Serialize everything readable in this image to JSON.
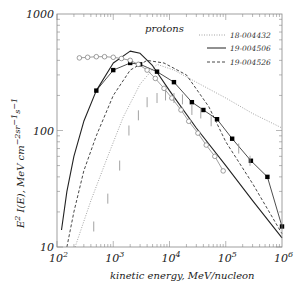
{
  "chart_data": {
    "type": "line",
    "title": "",
    "annotation": "protons",
    "xlabel": "kinetic energy,  MeV/nucleon",
    "ylabel": "E^2 I(E),  MeV cm^-2 sr^-1 s^-1",
    "xscale": "log",
    "yscale": "log",
    "xlim": [
      100,
      1000000
    ],
    "ylim": [
      10,
      1000
    ],
    "grid": false,
    "legend_position": "upper right",
    "x_ticks": [
      {
        "base": "10",
        "exp": "2"
      },
      {
        "base": "10",
        "exp": "3"
      },
      {
        "base": "10",
        "exp": "4"
      },
      {
        "base": "10",
        "exp": "5"
      },
      {
        "base": "10",
        "exp": "6"
      }
    ],
    "y_ticks": [
      "10",
      "100",
      "1000"
    ],
    "series": [
      {
        "name": "18-004432",
        "style": "dotted",
        "color": "#9a9a9a",
        "x": [
          210,
          400,
          800,
          1500,
          3000,
          6000,
          12000,
          30000,
          100000,
          300000,
          1000000
        ],
        "y": [
          10,
          25,
          60,
          130,
          250,
          370,
          330,
          260,
          190,
          140,
          105
        ]
      },
      {
        "name": "19-004506",
        "style": "solid",
        "color": "#222222",
        "x": [
          120,
          150,
          200,
          300,
          500,
          1000,
          2000,
          3000,
          5000,
          10000,
          30000,
          100000,
          300000,
          1000000
        ],
        "y": [
          14,
          30,
          60,
          120,
          220,
          380,
          480,
          460,
          360,
          220,
          105,
          50,
          25,
          12
        ]
      },
      {
        "name": "19-004526",
        "style": "dashed",
        "color": "#333333",
        "x": [
          150,
          200,
          300,
          500,
          1000,
          2000,
          4000,
          8000,
          20000,
          50000,
          100000,
          300000,
          1000000
        ],
        "y": [
          10,
          20,
          45,
          90,
          200,
          330,
          400,
          380,
          300,
          160,
          80,
          35,
          13
        ]
      },
      {
        "name": "measurements (filled squares)",
        "style": "solid-markers",
        "marker": "square",
        "color": "#000000",
        "x": [
          500,
          1000,
          2000,
          3000,
          6000,
          12000,
          25000,
          40000,
          70000,
          130000,
          280000,
          550000,
          1000000
        ],
        "y": [
          220,
          330,
          380,
          370,
          320,
          260,
          175,
          150,
          125,
          85,
          55,
          40,
          15
        ]
      },
      {
        "name": "measurements (open circles)",
        "style": "solid-markers",
        "marker": "circle",
        "color": "#777777",
        "x": [
          250,
          350,
          500,
          700,
          1000,
          1400,
          2000,
          2800,
          4000,
          5600,
          8000,
          11000,
          16000,
          22000,
          32000,
          45000,
          64000,
          90000
        ],
        "y": [
          420,
          425,
          430,
          430,
          425,
          415,
          400,
          370,
          330,
          280,
          230,
          190,
          150,
          120,
          95,
          75,
          60,
          45
        ]
      },
      {
        "name": "error bars (gray vertical ticks)",
        "style": "vertical-ticks",
        "color": "#999999",
        "x": [
          450,
          800,
          1300,
          1900,
          2800,
          4000,
          6000,
          8500,
          12000,
          17000,
          25000,
          36000,
          55000,
          170000,
          270000
        ],
        "y": [
          15,
          26,
          50,
          100,
          135,
          175,
          190,
          200,
          190,
          185,
          150,
          140,
          120,
          70,
          55
        ]
      }
    ]
  },
  "legend": [
    {
      "label": "18-004432",
      "style": "dotted"
    },
    {
      "label": "19-004506",
      "style": "solid"
    },
    {
      "label": "19-004526",
      "style": "dashed"
    }
  ]
}
